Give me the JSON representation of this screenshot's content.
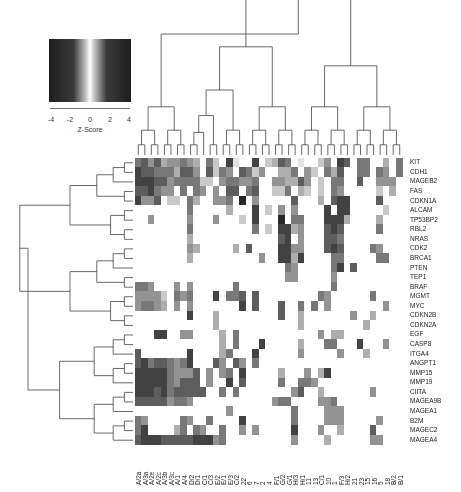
{
  "legend": {
    "title": "Z-Score",
    "ticks": [
      "-4",
      "-2",
      "0",
      "2",
      "4"
    ]
  },
  "chart_data": {
    "type": "heatmap",
    "title": "",
    "color_scale": {
      "label": "Z-Score",
      "range": [
        -4,
        4
      ],
      "low_color": "#222222",
      "mid_color": "#ffffff",
      "high_color": "#222222"
    },
    "rows": [
      "KIT",
      "CDH1",
      "MAGEB2",
      "FAS",
      "CDKN1A",
      "ALCAM",
      "TP53BP2",
      "RBL2",
      "NRAS",
      "CDK2",
      "BRCA1",
      "PTEN",
      "TEP1",
      "BRAF",
      "MGMT",
      "MYC",
      "CDKN2B",
      "CDKN2A",
      "EGF",
      "CASP8",
      "ITGA4",
      "ANGPT1",
      "MMP15",
      "MMP19",
      "CIITA",
      "MAGEA9B",
      "MAGEA1",
      "B2M",
      "MAGEC2",
      "MAGEA4"
    ],
    "columns": [
      "A/2a",
      "A/3a",
      "A/2e",
      "A/2c",
      "A/3b",
      "A/3c",
      "A/1",
      "A/4",
      "D/2",
      "D/1",
      "C/1",
      "C/3",
      "E/2",
      "E/1",
      "E/3",
      "C/2",
      "22",
      "6",
      "7",
      "2",
      "4",
      "F/1",
      "G/2",
      "G/1",
      "H/3",
      "H/1",
      "11",
      "13",
      "C/1",
      "10",
      "1",
      "F/3",
      "H/2",
      "21",
      "23",
      "15",
      "16",
      "5",
      "18",
      "B/2",
      "B/1"
    ],
    "grid": [
      "56463445430520710070236501002407605500305",
      "76655536640625406524003350420536005505405",
      "77766455552204554450044336402055006004440",
      "66754405054040660560022503202054000002030",
      "74460220530044508040000060003067700006000",
      "00000000500000300070204040000707700000200",
      "00400000400040002070008055000777300003000",
      "00000000500000000050207734000676000005000",
      "00000000300000000000006704000665000000000",
      "00000000430000030600007744000676000054000",
      "00000000300000000004007737000055000005500",
      "00000000000000000000000540000057060000000",
      "00000000000000000000000440000040000000000",
      "55400040400000050000000000000050000000000",
      "44442054500070556060000000005400000050000",
      "45543040400000007060006005050400000000400",
      "00000000700030000000006003000000040030000",
      "00000000000030000000000003000000000300000",
      "00077004400003050000000000004033000000000",
      "00000000000003050007000003000550007000400",
      "60000000700003500070000004000004000300000",
      "67566545700064064050000000000000000000000",
      "77777544460404507000003000403700000000000",
      "77777546660400706000005005540000000000000",
      "77767566666005050000000046003000000040000",
      "66666455400000000000045500004450000000000",
      "00000000000000400000000050000444000000000",
      "54000005400500007000000050000444000004000",
      "57000035054005004040000070004003000060000",
      "67776666677745000000000040000300000044000"
    ]
  }
}
